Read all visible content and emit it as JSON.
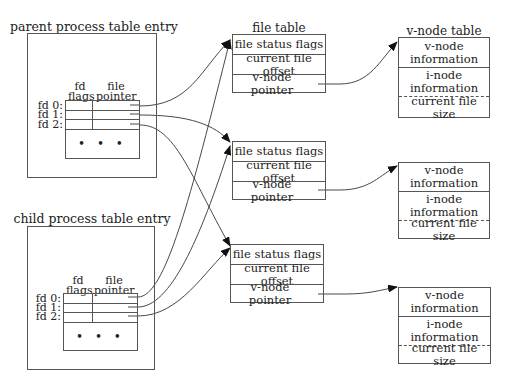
{
  "parent": {
    "title": "parent process table entry",
    "col_fd_flags": [
      "fd",
      "flags"
    ],
    "col_file_pointer": [
      "file",
      "pointer"
    ],
    "rows": [
      "fd 0:",
      "fd 1:",
      "fd 2:"
    ],
    "ellipsis": "• • •"
  },
  "child": {
    "title": "child process table entry",
    "col_fd_flags": [
      "fd",
      "flags"
    ],
    "col_file_pointer": [
      "file",
      "pointer"
    ],
    "rows": [
      "fd 0:",
      "fd 1:",
      "fd 2:"
    ],
    "ellipsis": "• • •"
  },
  "file_table": {
    "title": "file table",
    "entries": [
      {
        "status": "file status flags",
        "offset": "current file offset",
        "vnode": "v-node pointer"
      },
      {
        "status": "file status flags",
        "offset": "current file offset",
        "vnode": "v-node pointer"
      },
      {
        "status": "file status flags",
        "offset": "current file offset",
        "vnode": "v-node pointer"
      }
    ]
  },
  "vnode_table": {
    "title": "v-node table",
    "entries": [
      {
        "vnode_info": "v-node information",
        "inode_info": "i-node information",
        "size": "current file size"
      },
      {
        "vnode_info": "v-node information",
        "inode_info": "i-node information",
        "size": "current file size"
      },
      {
        "vnode_info": "v-node information",
        "inode_info": "i-node information",
        "size": "current file size"
      }
    ]
  },
  "connections": [
    {
      "from": "parent.fd0",
      "to": "file_table.0"
    },
    {
      "from": "parent.fd1",
      "to": "file_table.1"
    },
    {
      "from": "parent.fd2",
      "to": "file_table.2"
    },
    {
      "from": "child.fd0",
      "to": "file_table.0"
    },
    {
      "from": "child.fd1",
      "to": "file_table.1"
    },
    {
      "from": "child.fd2",
      "to": "file_table.2"
    },
    {
      "from": "file_table.0",
      "to": "vnode_table.0"
    },
    {
      "from": "file_table.1",
      "to": "vnode_table.1"
    },
    {
      "from": "file_table.2",
      "to": "vnode_table.2"
    }
  ]
}
